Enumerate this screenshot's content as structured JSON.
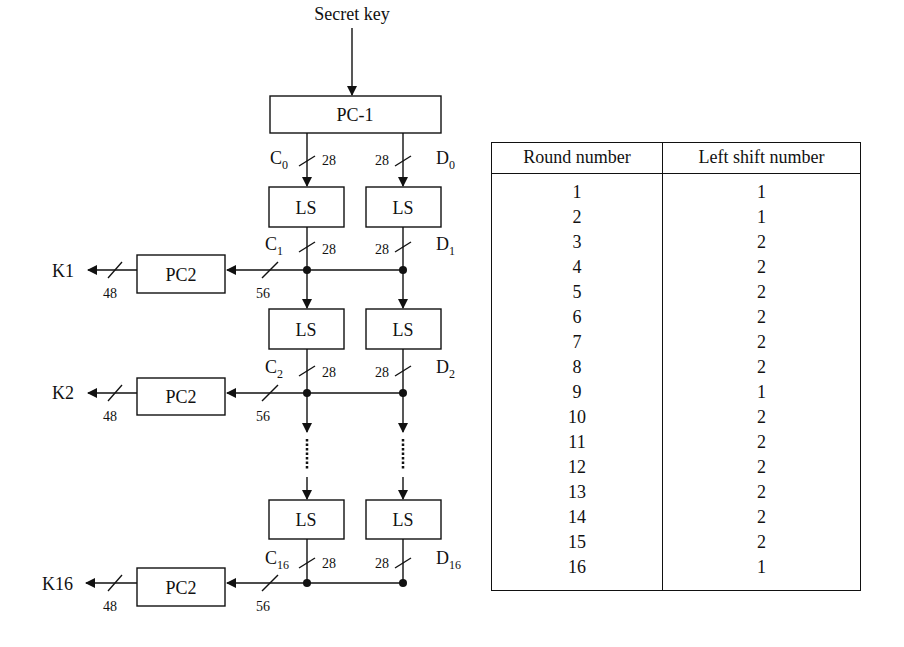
{
  "diagram": {
    "title_input": "Secret key",
    "pc1_label": "PC-1",
    "ls_label": "LS",
    "pc2_label": "PC2",
    "c_label": "C",
    "d_label": "D",
    "stages": [
      {
        "c_sub": "0",
        "d_sub": "0",
        "c_width": "28",
        "d_width": "28"
      },
      {
        "c_sub": "1",
        "d_sub": "1",
        "c_width": "28",
        "d_width": "28",
        "merge_width": "56",
        "key_width": "48",
        "key_label": "K1"
      },
      {
        "c_sub": "2",
        "d_sub": "2",
        "c_width": "28",
        "d_width": "28",
        "merge_width": "56",
        "key_width": "48",
        "key_label": "K2"
      },
      {
        "c_sub": "16",
        "d_sub": "16",
        "c_width": "28",
        "d_width": "28",
        "merge_width": "56",
        "key_width": "48",
        "key_label": "K16"
      }
    ]
  },
  "table": {
    "headers": [
      "Round number",
      "Left shift number"
    ],
    "rows": [
      [
        "1",
        "1"
      ],
      [
        "2",
        "1"
      ],
      [
        "3",
        "2"
      ],
      [
        "4",
        "2"
      ],
      [
        "5",
        "2"
      ],
      [
        "6",
        "2"
      ],
      [
        "7",
        "2"
      ],
      [
        "8",
        "2"
      ],
      [
        "9",
        "1"
      ],
      [
        "10",
        "2"
      ],
      [
        "11",
        "2"
      ],
      [
        "12",
        "2"
      ],
      [
        "13",
        "2"
      ],
      [
        "14",
        "2"
      ],
      [
        "15",
        "2"
      ],
      [
        "16",
        "1"
      ]
    ]
  }
}
